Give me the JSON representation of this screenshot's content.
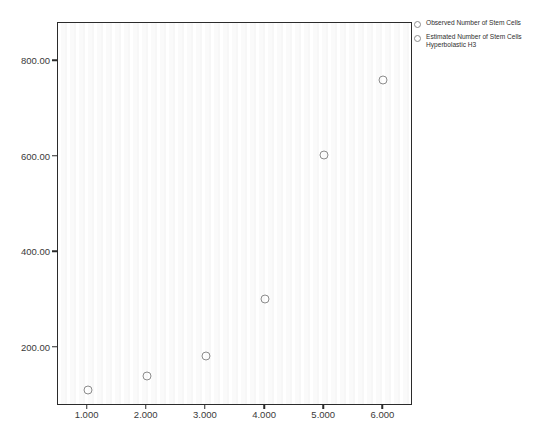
{
  "chart_data": {
    "type": "scatter",
    "title": "",
    "subtitle": "",
    "xlabel": "",
    "ylabel": "",
    "x": [
      1,
      2,
      3,
      4,
      5,
      6
    ],
    "xtick_labels": [
      "1.000",
      "2.000",
      "3.000",
      "4.000",
      "5.000",
      "6.000"
    ],
    "xtick_values": [
      1,
      2,
      3,
      4,
      5,
      6
    ],
    "ytick_labels": [
      "200.00",
      "400.00",
      "600.00",
      "800.00"
    ],
    "ytick_values": [
      200,
      400,
      600,
      800
    ],
    "xlim": [
      0.5,
      6.5
    ],
    "ylim": [
      78,
      880
    ],
    "grid": false,
    "legend_position": "top-right-outside",
    "series": [
      {
        "name": "Observed Number of Stem Cells",
        "marker": "open-circle",
        "color": "#8c8c8c",
        "values": [
          112,
          140,
          182,
          302,
          604,
          760
        ]
      },
      {
        "name": "Estimated Number of Stem Cells\nHyperbolastic H3",
        "marker": "open-circle",
        "color": "#8c8c8c",
        "values": [
          112,
          140,
          182,
          302,
          604,
          760
        ]
      }
    ],
    "points": [
      {
        "x": 1,
        "y": 112
      },
      {
        "x": 2,
        "y": 140
      },
      {
        "x": 3,
        "y": 182
      },
      {
        "x": 4,
        "y": 302
      },
      {
        "x": 5,
        "y": 604
      },
      {
        "x": 6,
        "y": 760
      }
    ]
  },
  "legend": {
    "entries": [
      {
        "label": "Observed Number of Stem Cells"
      },
      {
        "label": "Estimated Number of Stem Cells\nHyperbolastic H3"
      }
    ]
  },
  "colors": {
    "marker": "#8c8c8c",
    "axis": "#2b2b2b",
    "text": "#3a3a3a",
    "background": "#ffffff"
  }
}
